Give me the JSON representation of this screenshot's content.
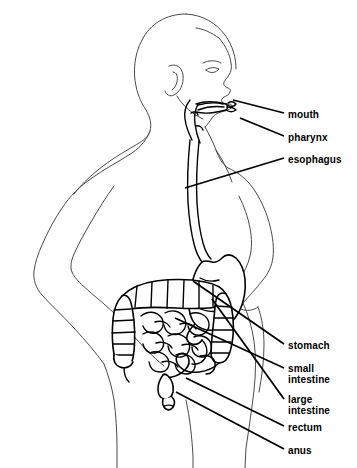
{
  "diagram": {
    "style": "black-and-white-line-art",
    "background_color": "#ffffff",
    "outline_color": "#4a4a4a",
    "organ_color": "#000000",
    "label_color": "#000000"
  },
  "labels": [
    {
      "id": "mouth",
      "text": "mouth",
      "x": 288,
      "y": 110
    },
    {
      "id": "pharynx",
      "text": "pharynx",
      "x": 288,
      "y": 133
    },
    {
      "id": "esophagus",
      "text": "esophagus",
      "x": 288,
      "y": 155
    },
    {
      "id": "stomach",
      "text": "stomach",
      "x": 288,
      "y": 341
    },
    {
      "id": "small-intestine",
      "text": "small\nintestine",
      "x": 288,
      "y": 364
    },
    {
      "id": "large-intestine",
      "text": "large\nintestine",
      "x": 288,
      "y": 395
    },
    {
      "id": "rectum",
      "text": "rectum",
      "x": 288,
      "y": 423
    },
    {
      "id": "anus",
      "text": "anus",
      "x": 288,
      "y": 446
    }
  ],
  "leader_lines": [
    {
      "id": "mouth-leader",
      "from_x": 284,
      "from_y": 113,
      "to_x": 233,
      "to_y": 100
    },
    {
      "id": "pharynx-leader",
      "from_x": 284,
      "from_y": 136,
      "to_x": 240,
      "to_y": 118
    },
    {
      "id": "esophagus-leader",
      "from_x": 284,
      "from_y": 158,
      "to_x": 185,
      "to_y": 188
    },
    {
      "id": "stomach-leader",
      "from_x": 284,
      "from_y": 344,
      "to_x": 193,
      "to_y": 281
    },
    {
      "id": "small-intestine-leader",
      "from_x": 284,
      "from_y": 368,
      "to_x": 175,
      "to_y": 318
    },
    {
      "id": "large-intestine-leader",
      "from_x": 284,
      "from_y": 399,
      "to_x": 212,
      "to_y": 299
    },
    {
      "id": "rectum-leader",
      "from_x": 284,
      "from_y": 426,
      "to_x": 186,
      "to_y": 378
    },
    {
      "id": "anus-leader",
      "from_x": 284,
      "from_y": 449,
      "to_x": 176,
      "to_y": 392
    }
  ],
  "organs": [
    {
      "id": "mouth-cavity",
      "name": "mouth"
    },
    {
      "id": "pharynx-tube",
      "name": "pharynx"
    },
    {
      "id": "esophagus-tube",
      "name": "esophagus"
    },
    {
      "id": "stomach-organ",
      "name": "stomach"
    },
    {
      "id": "small-intestine-coils",
      "name": "small intestine"
    },
    {
      "id": "large-intestine-colon",
      "name": "large intestine"
    },
    {
      "id": "rectum-organ",
      "name": "rectum"
    },
    {
      "id": "anus-opening",
      "name": "anus"
    }
  ]
}
